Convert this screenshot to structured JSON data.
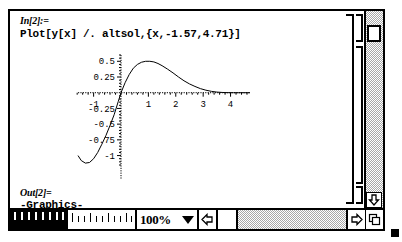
{
  "window": {
    "type": "mathematica-notebook"
  },
  "cells": {
    "input": {
      "label": "In[2]:=",
      "code": "Plot[y[x] /. altsol,{x,-1.57,4.71}]"
    },
    "output": {
      "label": "Out[2]=",
      "code": "-Graphics-"
    }
  },
  "bottom_bar": {
    "zoom_value": "100%",
    "zoom_caret_icon": "chevron-down-icon",
    "left_arrow_icon": "left-arrow-icon",
    "right_arrow_icon": "right-arrow-icon",
    "resize_icon": "window-resize-icon",
    "down_arrow_icon": "down-arrow-icon"
  },
  "chart_data": {
    "type": "line",
    "title": "",
    "xlabel": "",
    "ylabel": "",
    "xlim": [
      -1.57,
      4.71
    ],
    "ylim": [
      -1.15,
      0.6
    ],
    "grid": false,
    "legend": null,
    "xticks": [
      -1,
      1,
      2,
      3,
      4
    ],
    "xtick_labels": [
      "-1",
      "1",
      "2",
      "3",
      "4"
    ],
    "yticks": [
      0.5,
      0.25,
      -0.25,
      -0.5,
      -0.75,
      -1
    ],
    "ytick_labels": [
      "0.5",
      "0.25",
      "-0.25",
      "-0.5",
      "-0.75",
      "-1"
    ],
    "series": [
      {
        "name": "y[x] /. altsol",
        "x": [
          -1.57,
          -1.45,
          -1.3,
          -1.15,
          -1.0,
          -0.85,
          -0.7,
          -0.55,
          -0.4,
          -0.25,
          -0.1,
          0.0,
          0.15,
          0.3,
          0.45,
          0.6,
          0.75,
          0.9,
          1.05,
          1.2,
          1.35,
          1.5,
          1.7,
          1.9,
          2.1,
          2.3,
          2.5,
          2.7,
          2.9,
          3.1,
          3.3,
          3.5,
          3.7,
          3.9,
          4.1,
          4.3,
          4.5,
          4.71
        ],
        "y": [
          -1.0,
          -1.08,
          -1.12,
          -1.11,
          -1.05,
          -0.95,
          -0.82,
          -0.68,
          -0.52,
          -0.35,
          -0.14,
          0.0,
          0.16,
          0.29,
          0.39,
          0.45,
          0.485,
          0.5,
          0.5,
          0.49,
          0.465,
          0.43,
          0.375,
          0.315,
          0.25,
          0.19,
          0.14,
          0.1,
          0.065,
          0.04,
          0.022,
          0.01,
          0.004,
          0.001,
          0.0,
          0.0,
          0.0,
          0.0
        ]
      }
    ]
  }
}
